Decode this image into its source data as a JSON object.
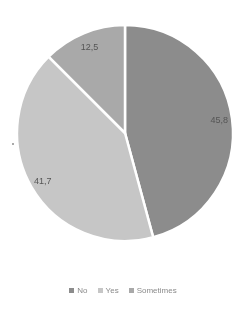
{
  "chart_data": {
    "type": "pie",
    "title": "",
    "categories": [
      "No",
      "Yes",
      "Sometimes"
    ],
    "values": [
      45.8,
      41.7,
      12.5
    ],
    "labels": [
      "45,8",
      "41,7",
      "12,5"
    ],
    "colors": [
      "#8c8c8c",
      "#c6c6c6",
      "#a9a9a9"
    ],
    "start_angle_deg": 0,
    "direction": "clockwise",
    "legend_position": "bottom"
  },
  "legend": {
    "items": [
      {
        "label": "No",
        "color": "#8c8c8c"
      },
      {
        "label": "Yes",
        "color": "#c6c6c6"
      },
      {
        "label": "Sometimes",
        "color": "#a9a9a9"
      }
    ]
  }
}
